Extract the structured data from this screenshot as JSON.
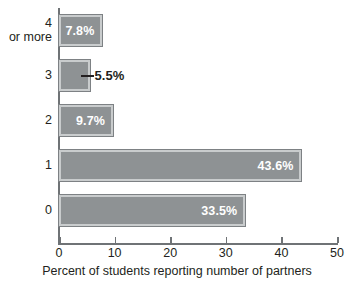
{
  "chart_data": {
    "type": "bar",
    "orientation": "horizontal",
    "title": "",
    "subtitle": "",
    "xlabel": "Percent of students reporting number of partners",
    "ylabel": "",
    "xlim": [
      0,
      50
    ],
    "xticks": [
      0,
      10,
      20,
      30,
      40,
      50
    ],
    "xtick_labels": [
      "0",
      "10",
      "20",
      "30",
      "40",
      "50"
    ],
    "grid": false,
    "legend": false,
    "categories": [
      "4 or more",
      "3",
      "2",
      "1",
      "0"
    ],
    "category_labels": [
      "4\nor more",
      "3",
      "2",
      "1",
      "0"
    ],
    "values": [
      7.8,
      5.5,
      9.7,
      43.6,
      33.5
    ],
    "data_labels": [
      "7.8%",
      "5.5%",
      "9.7%",
      "43.6%",
      "33.5%"
    ],
    "label_placement": [
      "inside",
      "outside",
      "inside",
      "inside",
      "inside"
    ],
    "colors": {
      "bar_fill": "#8e9294",
      "bar_inner_outline": "#c9cccd",
      "bar_outer_border": "#7d8184",
      "inside_label": "#ffffff",
      "outside_label": "#231f20",
      "axis": "#6f7376",
      "text": "#231f20",
      "background": "#ffffff"
    }
  }
}
